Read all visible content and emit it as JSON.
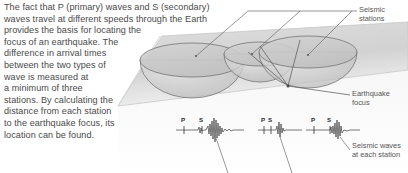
{
  "figure": {
    "width": 408,
    "height": 173,
    "background_color": "#ffffff",
    "ink_color": "#4a4a4a"
  },
  "caption": {
    "lines": [
      "The fact that P (primary) waves and S (secondary)",
      "waves travel at different speeds through the Earth",
      "provides the basis for locating the",
      "focus of an earthquake. The",
      "difference in arrival times",
      "between the two types of",
      "wave is measured at",
      "a minimum of three",
      "stations. By calculating the",
      "distance from each station",
      "to the earthquake focus, its",
      "location can be found."
    ],
    "text": "The fact that P (primary) waves and S (secondary) waves travel at different speeds through the Earth provides the basis for locating the focus of an earthquake. The difference in arrival times between the two types of wave is measured at a minimum of three stations. By calculating the distance from each station to the earthquake focus, its location can be found."
  },
  "annotations": [
    {
      "id": "seismic-stations",
      "label": "Seismic\nstations"
    },
    {
      "id": "earthquake-focus",
      "label": "Earthquake\nfocus"
    },
    {
      "id": "seismic-waves",
      "label": "Seismic waves\nat each station"
    }
  ],
  "diagram": {
    "ground_plane": {
      "name": "ground-plane",
      "fill": "#d9d9d9",
      "stroke": "#bdbdbd"
    },
    "hemispheres": [
      {
        "name": "hemisphere-station-1",
        "cx": 192,
        "cy": 62,
        "rx": 52,
        "ry": 38,
        "fill": "#cfcfcf",
        "stroke": "#7a7a7a"
      },
      {
        "name": "hemisphere-station-2",
        "cx": 258,
        "cy": 55,
        "rx": 36,
        "ry": 28,
        "fill": "#c9c9c9",
        "stroke": "#7a7a7a"
      },
      {
        "name": "hemisphere-station-3",
        "cx": 308,
        "cy": 58,
        "rx": 49,
        "ry": 36,
        "fill": "#cccccc",
        "stroke": "#7a7a7a"
      }
    ],
    "focus_point": {
      "name": "earthquake-focus-point",
      "x": 288,
      "y": 86
    },
    "station_points": [
      {
        "name": "station-point-1",
        "x": 196,
        "y": 62
      },
      {
        "name": "station-point-2",
        "x": 250,
        "y": 58
      },
      {
        "name": "station-point-3",
        "x": 306,
        "y": 60
      }
    ]
  },
  "seismograms": [
    {
      "name": "seismogram-station-1",
      "p_label": "P",
      "s_label": "S",
      "p_x": 182,
      "s_x": 201,
      "baseline_y": 130,
      "peak_x": 215
    },
    {
      "name": "seismogram-station-2",
      "p_label": "P",
      "s_label": "S",
      "p_x": 263,
      "s_x": 270,
      "baseline_y": 130,
      "peak_x": 281
    },
    {
      "name": "seismogram-station-3",
      "p_label": "P",
      "s_label": "S",
      "p_x": 312,
      "s_x": 328,
      "baseline_y": 130,
      "peak_x": 339
    }
  ]
}
